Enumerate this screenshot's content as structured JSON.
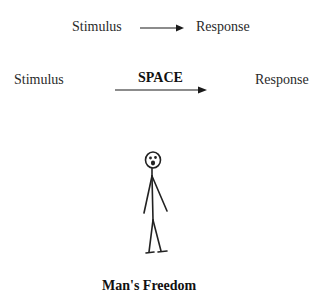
{
  "diagram": {
    "row1": {
      "stimulus": "Stimulus",
      "response": "Response"
    },
    "row2": {
      "stimulus": "Stimulus",
      "space": "SPACE",
      "response": "Response"
    },
    "caption": "Man's Freedom",
    "figure": "stick-figure-person"
  },
  "colors": {
    "ink": "#1a1a1a",
    "text": "#2a2a2a",
    "background": "#ffffff"
  }
}
